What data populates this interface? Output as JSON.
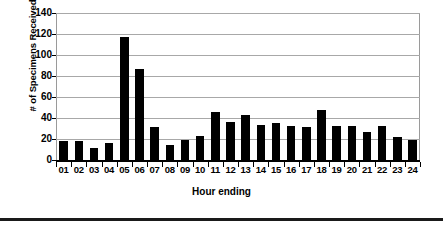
{
  "chart_data": {
    "type": "bar",
    "title": "",
    "xlabel": "Hour ending",
    "ylabel": "# of Specimens Received",
    "categories": [
      "01",
      "02",
      "03",
      "04",
      "05",
      "06",
      "07",
      "08",
      "09",
      "10",
      "11",
      "12",
      "13",
      "14",
      "15",
      "16",
      "17",
      "18",
      "19",
      "20",
      "21",
      "22",
      "23",
      "24"
    ],
    "values": [
      18,
      18,
      11,
      16,
      117,
      87,
      31,
      14,
      19,
      23,
      46,
      36,
      43,
      33,
      35,
      32,
      31,
      48,
      32,
      32,
      27,
      32,
      22,
      19
    ],
    "ylim": [
      0,
      140
    ],
    "yticks": [
      0,
      20,
      40,
      60,
      80,
      100,
      120,
      140
    ],
    "ytick_labels": [
      "0",
      "20",
      "40",
      "60",
      "80",
      "100",
      "120",
      "140"
    ],
    "grid": true,
    "grid_axis": "y",
    "legend": false,
    "legend_position": "none",
    "bar_color": "#000000",
    "grid_color": "#a8a8a8",
    "background_color": "#ffffff"
  }
}
